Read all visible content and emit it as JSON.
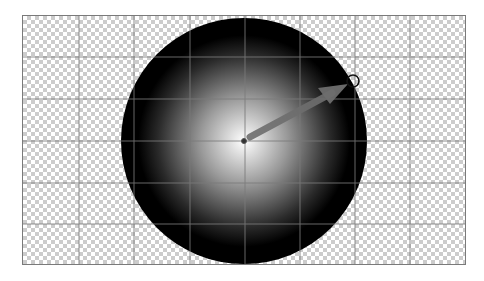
{
  "editor": {
    "canvas": {
      "x": 22,
      "y": 15,
      "width": 444,
      "height": 250,
      "background": "transparency-checkerboard",
      "checker_colors": [
        "#ffffff",
        "#cccccc"
      ]
    },
    "grid": {
      "color": "#7a7a7a",
      "vertical_lines_x": [
        79,
        134,
        190,
        245,
        300,
        355,
        410
      ],
      "horizontal_lines_y": [
        57,
        99,
        141,
        183,
        224
      ]
    },
    "radial_gradient": {
      "shape": "circle",
      "center": [
        244,
        141
      ],
      "radius": 123,
      "stops": [
        {
          "offset": 0,
          "color": "#ffffff"
        },
        {
          "offset": 0.35,
          "color": "#9a9a9a"
        },
        {
          "offset": 0.7,
          "color": "#2a2a2a"
        },
        {
          "offset": 0.85,
          "color": "#000000"
        }
      ]
    },
    "gradient_tool": {
      "origin_handle": {
        "x": 244,
        "y": 141
      },
      "direction_arrow": {
        "from": [
          248,
          138
        ],
        "to": [
          348,
          84
        ],
        "color": "#6e6e6e"
      },
      "end_handle": {
        "x": 353,
        "y": 81,
        "r": 6
      }
    }
  }
}
